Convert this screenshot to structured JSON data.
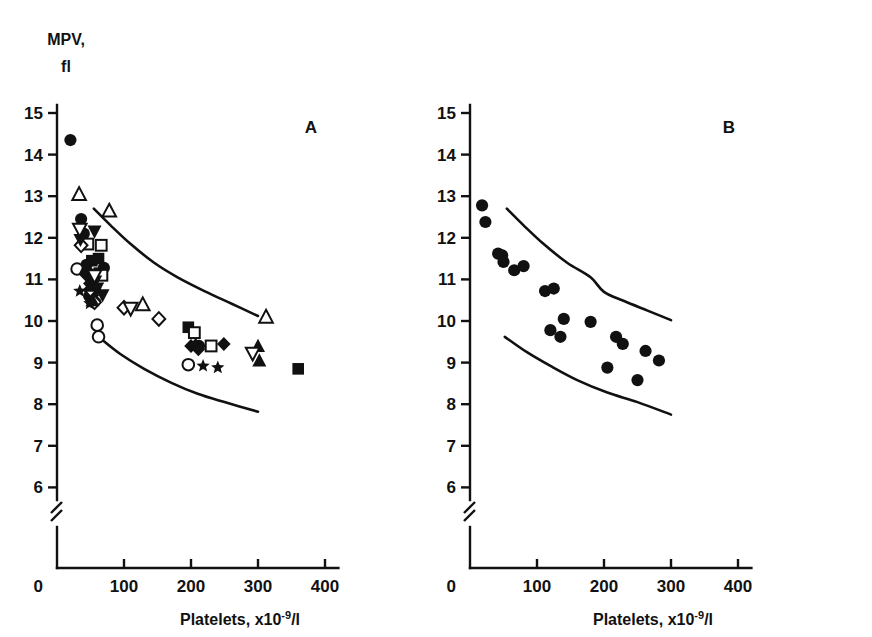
{
  "figure": {
    "y_axis_title_line1": "MPV,",
    "y_axis_title_line2": "fl",
    "x_axis_title_main": "Platelets, x10",
    "x_axis_title_sup": "-9",
    "x_axis_title_tail": "/l",
    "panel_a_label": "A",
    "panel_b_label": "B",
    "ink_color": "#111111",
    "background_color": "#ffffff"
  },
  "chart_data": [
    {
      "type": "scatter",
      "panel": "A",
      "title": "A",
      "xlabel": "Platelets, x10-9/l",
      "ylabel": "MPV, fl",
      "xlim": [
        0,
        420
      ],
      "ylim": [
        5.6,
        15.4
      ],
      "xticks": [
        0,
        100,
        200,
        300,
        400
      ],
      "yticks": [
        6,
        7,
        8,
        9,
        10,
        11,
        12,
        13,
        14,
        15
      ],
      "y_axis_break": true,
      "y_axis_break_between": [
        0,
        6
      ],
      "grid": false,
      "legend": "none",
      "series": [
        {
          "name": "filled-circle",
          "marker": "filled-circle",
          "points": [
            [
              20,
              14.35
            ],
            [
              36,
              12.45
            ],
            [
              40,
              12.1
            ],
            [
              44,
              11.35
            ],
            [
              47,
              11.15
            ],
            [
              52,
              11.0
            ],
            [
              57,
              10.8
            ],
            [
              48,
              10.6
            ],
            [
              54,
              10.45
            ],
            [
              70,
              11.28
            ],
            [
              212,
              9.4
            ]
          ]
        },
        {
          "name": "open-circle",
          "marker": "open-circle",
          "points": [
            [
              30,
              11.25
            ],
            [
              60,
              9.9
            ],
            [
              62,
              9.62
            ],
            [
              196,
              8.95
            ]
          ]
        },
        {
          "name": "filled-square",
          "marker": "filled-square",
          "points": [
            [
              52,
              11.45
            ],
            [
              62,
              11.5
            ],
            [
              63,
              11.15
            ],
            [
              196,
              9.85
            ],
            [
              360,
              8.85
            ]
          ]
        },
        {
          "name": "open-square",
          "marker": "open-square",
          "points": [
            [
              46,
              11.85
            ],
            [
              66,
              11.82
            ],
            [
              67,
              11.1
            ],
            [
              205,
              9.72
            ],
            [
              230,
              9.4
            ]
          ]
        },
        {
          "name": "filled-diamond",
          "marker": "filled-diamond",
          "points": [
            [
              44,
              11.1
            ],
            [
              49,
              10.9
            ],
            [
              53,
              10.62
            ],
            [
              56,
              10.5
            ],
            [
              200,
              9.4
            ],
            [
              207,
              9.42
            ],
            [
              211,
              9.32
            ],
            [
              249,
              9.45
            ]
          ]
        },
        {
          "name": "open-diamond",
          "marker": "open-diamond",
          "points": [
            [
              36,
              11.82
            ],
            [
              50,
              10.75
            ],
            [
              56,
              10.45
            ],
            [
              100,
              10.32
            ],
            [
              152,
              10.05
            ]
          ]
        },
        {
          "name": "filled-up-triangle",
          "marker": "filled-up-triangle",
          "points": [
            [
              42,
              11.25
            ],
            [
              50,
              10.85
            ],
            [
              53,
              10.5
            ],
            [
              300,
              9.4
            ],
            [
              302,
              9.05
            ]
          ]
        },
        {
          "name": "open-up-triangle",
          "marker": "open-up-triangle",
          "points": [
            [
              33,
              13.05
            ],
            [
              78,
              12.65
            ],
            [
              128,
              10.4
            ],
            [
              312,
              10.1
            ]
          ]
        },
        {
          "name": "filled-down-triangle",
          "marker": "filled-down-triangle",
          "points": [
            [
              56,
              12.15
            ],
            [
              35,
              11.95
            ],
            [
              52,
              11.05
            ],
            [
              57,
              10.95
            ],
            [
              60,
              10.78
            ],
            [
              68,
              10.62
            ]
          ]
        },
        {
          "name": "open-down-triangle",
          "marker": "open-down-triangle",
          "points": [
            [
              34,
              12.2
            ],
            [
              56,
              11.08
            ],
            [
              110,
              10.3
            ],
            [
              292,
              9.22
            ]
          ]
        },
        {
          "name": "filled-star",
          "marker": "filled-star",
          "points": [
            [
              34,
              10.72
            ],
            [
              49,
              10.42
            ],
            [
              218,
              8.92
            ],
            [
              240,
              8.88
            ]
          ]
        }
      ],
      "reference_curves": [
        {
          "name": "upper-normal-limit",
          "points": [
            [
              55,
              12.7
            ],
            [
              80,
              12.3
            ],
            [
              110,
              11.85
            ],
            [
              145,
              11.4
            ],
            [
              180,
              11.05
            ],
            [
              220,
              10.72
            ],
            [
              260,
              10.42
            ],
            [
              300,
              10.12
            ]
          ]
        },
        {
          "name": "lower-normal-limit",
          "points": [
            [
              65,
              9.58
            ],
            [
              95,
              9.2
            ],
            [
              130,
              8.85
            ],
            [
              170,
              8.52
            ],
            [
              210,
              8.25
            ],
            [
              250,
              8.05
            ],
            [
              300,
              7.82
            ]
          ]
        }
      ]
    },
    {
      "type": "scatter",
      "panel": "B",
      "title": "B",
      "xlabel": "Platelets, x10-9/l",
      "ylabel": "MPV, fl",
      "xlim": [
        0,
        420
      ],
      "ylim": [
        5.6,
        15.4
      ],
      "xticks": [
        0,
        100,
        200,
        300,
        400
      ],
      "yticks": [
        6,
        7,
        8,
        9,
        10,
        11,
        12,
        13,
        14,
        15
      ],
      "y_axis_break": true,
      "y_axis_break_between": [
        0,
        6
      ],
      "grid": false,
      "legend": "none",
      "series": [
        {
          "name": "filled-circle",
          "marker": "filled-circle",
          "points": [
            [
              18,
              12.78
            ],
            [
              23,
              12.38
            ],
            [
              42,
              11.62
            ],
            [
              48,
              11.58
            ],
            [
              50,
              11.42
            ],
            [
              66,
              11.22
            ],
            [
              80,
              11.32
            ],
            [
              112,
              10.72
            ],
            [
              125,
              10.78
            ],
            [
              140,
              10.05
            ],
            [
              120,
              9.78
            ],
            [
              135,
              9.62
            ],
            [
              180,
              9.98
            ],
            [
              218,
              9.62
            ],
            [
              228,
              9.45
            ],
            [
              205,
              8.88
            ],
            [
              262,
              9.28
            ],
            [
              250,
              8.58
            ],
            [
              282,
              9.05
            ]
          ]
        }
      ],
      "reference_curves": [
        {
          "name": "upper-normal-limit",
          "points": [
            [
              55,
              12.7
            ],
            [
              80,
              12.3
            ],
            [
              110,
              11.85
            ],
            [
              145,
              11.4
            ],
            [
              180,
              11.05
            ],
            [
              200,
              10.7
            ],
            [
              230,
              10.48
            ],
            [
              265,
              10.25
            ],
            [
              300,
              10.02
            ]
          ]
        },
        {
          "name": "lower-normal-limit",
          "points": [
            [
              52,
              9.62
            ],
            [
              85,
              9.25
            ],
            [
              120,
              8.92
            ],
            [
              160,
              8.58
            ],
            [
              205,
              8.28
            ],
            [
              250,
              8.05
            ],
            [
              300,
              7.75
            ]
          ]
        }
      ]
    }
  ]
}
